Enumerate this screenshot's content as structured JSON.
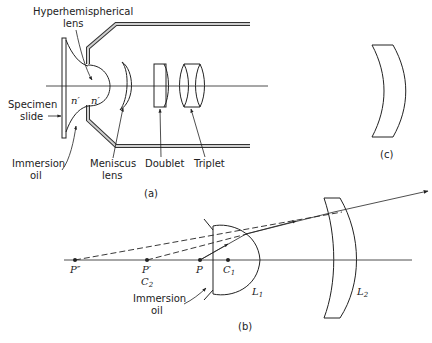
{
  "figure": {
    "panel_a": {
      "caption": "(a)",
      "labels": {
        "hyperhemispherical_line1": "Hyperhemispherical",
        "hyperhemispherical_line2": "lens",
        "specimen_line1": "Specimen",
        "specimen_line2": "slide",
        "immersion_line1": "Immersion",
        "immersion_line2": "oil",
        "meniscus_line1": "Meniscus",
        "meniscus_line2": "lens",
        "doublet": "Doublet",
        "triplet": "Triplet",
        "n_prime_left": "n′",
        "n_prime_right": "n′"
      }
    },
    "panel_b": {
      "caption": "(b)",
      "points": {
        "p_double_prime": "P″",
        "p_prime": "P′",
        "c2": "C",
        "c2_sub": "2",
        "p": "P",
        "c1": "C",
        "c1_sub": "1"
      },
      "lenses": {
        "l1": "L",
        "l1_sub": "1",
        "l2": "L",
        "l2_sub": "2"
      },
      "immersion_line1": "Immersion",
      "immersion_line2": "oil"
    },
    "panel_c": {
      "caption": "(c)"
    }
  }
}
